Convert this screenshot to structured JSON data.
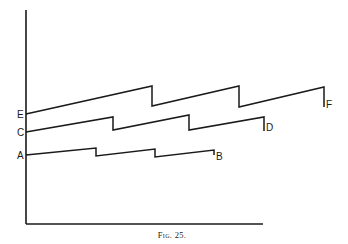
{
  "figure": {
    "caption": "Fig. 25.",
    "axes": {
      "y_axis": {
        "x": 26,
        "y_top": 10,
        "y_bottom": 224
      },
      "x_axis": {
        "y": 224,
        "x_left": 26,
        "x_right": 263
      }
    },
    "lines": [
      {
        "name": "E-F",
        "start_label": "E",
        "end_label": "F",
        "points": [
          [
            26,
            114
          ],
          [
            152,
            86
          ],
          [
            152,
            106
          ],
          [
            239,
            86
          ],
          [
            239,
            107
          ],
          [
            324,
            87
          ],
          [
            324,
            107
          ]
        ],
        "start_label_pos": [
          17,
          118
        ],
        "end_label_pos": [
          326,
          108
        ]
      },
      {
        "name": "C-D",
        "start_label": "C",
        "end_label": "D",
        "points": [
          [
            26,
            132
          ],
          [
            113,
            117
          ],
          [
            113,
            130
          ],
          [
            189,
            115
          ],
          [
            189,
            130
          ],
          [
            264,
            117
          ],
          [
            264,
            131
          ]
        ],
        "start_label_pos": [
          17,
          136
        ],
        "end_label_pos": [
          266,
          131
        ]
      },
      {
        "name": "A-B",
        "start_label": "A",
        "end_label": "B",
        "points": [
          [
            26,
            155
          ],
          [
            96,
            148
          ],
          [
            96,
            156
          ],
          [
            155,
            149
          ],
          [
            155,
            157
          ],
          [
            214,
            150
          ],
          [
            214,
            155
          ]
        ],
        "start_label_pos": [
          17,
          159
        ],
        "end_label_pos": [
          216,
          160
        ]
      }
    ]
  }
}
